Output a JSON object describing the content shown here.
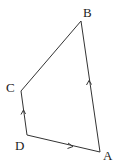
{
  "diagram": {
    "type": "quadrilateral",
    "vertices": [
      {
        "name": "A",
        "x": 100,
        "y": 152,
        "label_x": 103,
        "label_y": 160
      },
      {
        "name": "B",
        "x": 81,
        "y": 21,
        "label_x": 83,
        "label_y": 17
      },
      {
        "name": "C",
        "x": 21,
        "y": 91,
        "label_x": 6,
        "label_y": 92
      },
      {
        "name": "D",
        "x": 27,
        "y": 135,
        "label_x": 15,
        "label_y": 150
      }
    ],
    "edges": [
      {
        "from": "A",
        "to": "B",
        "arrow": true
      },
      {
        "from": "B",
        "to": "C",
        "arrow": false
      },
      {
        "from": "C",
        "to": "D",
        "arrow": true,
        "arrow_direction": "D-to-C"
      },
      {
        "from": "D",
        "to": "A",
        "arrow": true,
        "arrow_direction": "D-to-A"
      }
    ],
    "labels": {
      "A": "A",
      "B": "B",
      "C": "C",
      "D": "D"
    }
  }
}
